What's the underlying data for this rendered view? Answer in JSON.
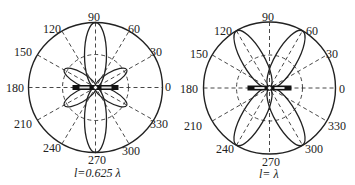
{
  "figure": {
    "type": "polar radiation pattern diagrams",
    "angle_labels": [
      "0",
      "30",
      "60",
      "90",
      "120",
      "150",
      "180",
      "210",
      "240",
      "270",
      "300",
      "330"
    ],
    "colors": {
      "ink": "#222222",
      "background": "#ffffff"
    }
  },
  "plots": [
    {
      "caption": "l=0.625 λ",
      "main_lobes_deg": [
        90,
        270
      ],
      "minor_lobes_deg": [
        30,
        150,
        210,
        330
      ],
      "main_lobe_relative_length": 1.0,
      "minor_lobe_relative_length": 0.5
    },
    {
      "caption": "l= λ",
      "main_lobes_deg": [
        60,
        120,
        240,
        300
      ],
      "main_lobe_relative_length": 1.0
    }
  ],
  "labels": {
    "left": {
      "a0": "0",
      "a30": "30",
      "a60": "60",
      "a90": "90",
      "a120": "120",
      "a150": "150",
      "a180": "180",
      "a210": "210",
      "a240": "240",
      "a270": "270",
      "a300": "300",
      "a330": "330",
      "caption": "l=0.625 λ"
    },
    "right": {
      "a0": "0",
      "a30": "30",
      "a60": "60",
      "a90": "90",
      "a120": "120",
      "a150": "150",
      "a180": "180",
      "a210": "210",
      "a240": "240",
      "a270": "270",
      "a300": "300",
      "a330": "330",
      "caption": "l= λ"
    }
  }
}
